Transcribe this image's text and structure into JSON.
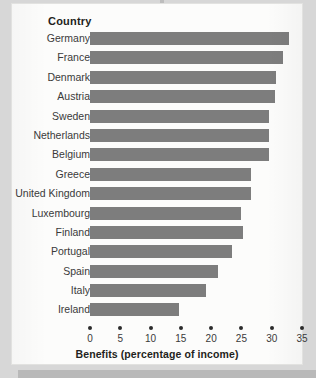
{
  "header": {
    "column_header": "Country"
  },
  "chart_data": {
    "type": "bar",
    "orientation": "horizontal",
    "title": "",
    "xlabel": "Benefits (percentage of income)",
    "ylabel": "Country",
    "xlim": [
      0,
      35
    ],
    "xticks": [
      0,
      5,
      10,
      15,
      20,
      25,
      30,
      35
    ],
    "xtick_labels": [
      "0",
      "5",
      "10",
      "15",
      "20",
      "25",
      "30",
      "35"
    ],
    "grid": false,
    "legend": null,
    "bar_color": "#7d7d7d",
    "categories": [
      "Germany",
      "France",
      "Denmark",
      "Austria",
      "Sweden",
      "Netherlands",
      "Belgium",
      "Greece",
      "United Kingdom",
      "Luxembourg",
      "Finland",
      "Portugal",
      "Spain",
      "Italy",
      "Ireland"
    ],
    "values": [
      32.8,
      31.9,
      30.7,
      30.5,
      29.6,
      29.6,
      29.6,
      26.5,
      26.5,
      25.0,
      25.2,
      23.4,
      21.2,
      19.2,
      14.7
    ]
  }
}
